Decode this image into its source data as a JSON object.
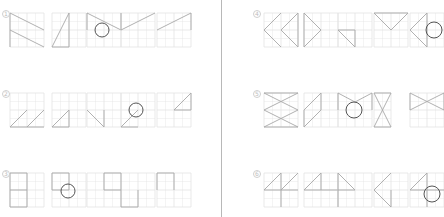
{
  "colors": {
    "grid": "#e3e3e3",
    "line": "#a8a8a8",
    "circle": "#555555",
    "divider": "#b8b8b8"
  },
  "rows": [
    {
      "label": "1",
      "lx": 2,
      "ly": 10,
      "panels": [
        {
          "x": 10,
          "y": 13,
          "w": 34,
          "h": 34,
          "lines": [
            [
              0,
              0,
              34,
              17
            ],
            [
              0,
              17,
              34,
              34
            ],
            [
              0,
              0,
              0,
              34
            ]
          ],
          "circle": null
        },
        {
          "x": 52,
          "y": 13,
          "w": 34,
          "h": 34,
          "lines": [
            [
              17,
              0,
              0,
              34
            ],
            [
              0,
              34,
              17,
              34
            ],
            [
              17,
              0,
              17,
              34
            ]
          ],
          "circle": null
        },
        {
          "x": 87,
          "y": 13,
          "w": 34,
          "h": 34,
          "lines": [
            [
              0,
              0,
              34,
              17
            ],
            [
              0,
              0,
              0,
              17
            ]
          ],
          "circle": [
            15,
            17,
            7
          ]
        },
        {
          "x": 121,
          "y": 13,
          "w": 34,
          "h": 34,
          "lines": [
            [
              0,
              17,
              34,
              0
            ],
            [
              0,
              0,
              0,
              17
            ]
          ],
          "circle": null
        },
        {
          "x": 157,
          "y": 13,
          "w": 34,
          "h": 34,
          "lines": [
            [
              0,
              17,
              34,
              0
            ],
            [
              34,
              0,
              34,
              17
            ]
          ],
          "circle": null
        }
      ]
    },
    {
      "label": "2",
      "lx": 2,
      "ly": 90,
      "panels": [
        {
          "x": 10,
          "y": 93,
          "w": 34,
          "h": 34,
          "lines": [
            [
              0,
              34,
              17,
              17
            ],
            [
              17,
              34,
              34,
              17
            ],
            [
              0,
              34,
              34,
              34
            ]
          ],
          "circle": null
        },
        {
          "x": 52,
          "y": 93,
          "w": 34,
          "h": 34,
          "lines": [
            [
              0,
              34,
              17,
              17
            ],
            [
              17,
              17,
              17,
              34
            ],
            [
              0,
              34,
              17,
              34
            ]
          ],
          "circle": null
        },
        {
          "x": 87,
          "y": 93,
          "w": 34,
          "h": 34,
          "lines": [
            [
              0,
              17,
              17,
              34
            ],
            [
              17,
              17,
              17,
              34
            ]
          ],
          "circle": null
        },
        {
          "x": 121,
          "y": 93,
          "w": 34,
          "h": 34,
          "lines": [
            [
              0,
              34,
              17,
              17
            ],
            [
              0,
              34,
              17,
              34
            ]
          ],
          "circle": [
            15,
            17,
            7
          ]
        },
        {
          "x": 157,
          "y": 93,
          "w": 34,
          "h": 34,
          "lines": [
            [
              17,
              17,
              34,
              0
            ],
            [
              17,
              17,
              34,
              17
            ],
            [
              34,
              0,
              34,
              17
            ]
          ],
          "circle": null
        }
      ]
    },
    {
      "label": "3",
      "lx": 2,
      "ly": 170,
      "panels": [
        {
          "x": 10,
          "y": 173,
          "w": 34,
          "h": 34,
          "lines": [
            [
              0,
              0,
              17,
              0
            ],
            [
              0,
              17,
              17,
              17
            ],
            [
              0,
              34,
              17,
              34
            ],
            [
              0,
              0,
              0,
              34
            ],
            [
              17,
              0,
              17,
              34
            ]
          ],
          "circle": null
        },
        {
          "x": 52,
          "y": 173,
          "w": 34,
          "h": 34,
          "lines": [
            [
              0,
              0,
              17,
              0
            ],
            [
              0,
              17,
              17,
              17
            ],
            [
              0,
              0,
              0,
              17
            ],
            [
              17,
              0,
              17,
              17
            ]
          ],
          "circle": [
            16,
            18,
            7
          ]
        },
        {
          "x": 87,
          "y": 173,
          "w": 68,
          "h": 34,
          "lines": [
            [
              17,
              0,
              34,
              0
            ],
            [
              17,
              17,
              34,
              17
            ],
            [
              17,
              0,
              17,
              17
            ],
            [
              34,
              0,
              34,
              17
            ],
            [
              34,
              17,
              34,
              34
            ],
            [
              51,
              17,
              51,
              34
            ],
            [
              34,
              34,
              51,
              34
            ]
          ],
          "circle": null
        },
        {
          "x": 157,
          "y": 173,
          "w": 34,
          "h": 34,
          "lines": [
            [
              0,
              0,
              17,
              0
            ],
            [
              0,
              0,
              0,
              17
            ],
            [
              17,
              0,
              17,
              17
            ]
          ],
          "circle": null
        }
      ]
    }
  ],
  "rows_right": [
    {
      "label": "4",
      "lx": 253,
      "ly": 10,
      "panels": [
        {
          "x": 264,
          "y": 13,
          "w": 34,
          "h": 34,
          "lines": [
            [
              17,
              0,
              0,
              17
            ],
            [
              0,
              17,
              17,
              34
            ],
            [
              34,
              0,
              17,
              17
            ],
            [
              17,
              17,
              34,
              34
            ],
            [
              34,
              0,
              34,
              34
            ]
          ],
          "circle": null
        },
        {
          "x": 304,
          "y": 13,
          "w": 34,
          "h": 34,
          "lines": [
            [
              0,
              0,
              17,
              17
            ],
            [
              17,
              17,
              0,
              34
            ],
            [
              0,
              0,
              0,
              34
            ]
          ],
          "circle": null
        },
        {
          "x": 338,
          "y": 13,
          "w": 34,
          "h": 34,
          "lines": [
            [
              0,
              17,
              17,
              34
            ],
            [
              0,
              17,
              17,
              17
            ],
            [
              17,
              17,
              17,
              34
            ]
          ],
          "circle": null
        },
        {
          "x": 374,
          "y": 13,
          "w": 34,
          "h": 34,
          "lines": [
            [
              0,
              0,
              34,
              0
            ],
            [
              0,
              0,
              17,
              17
            ],
            [
              34,
              0,
              17,
              17
            ]
          ],
          "circle": null
        },
        {
          "x": 410,
          "y": 13,
          "w": 34,
          "h": 34,
          "lines": [
            [
              17,
              0,
              0,
              17
            ],
            [
              0,
              17,
              17,
              34
            ],
            [
              17,
              0,
              17,
              34
            ]
          ],
          "circle": [
            24,
            17,
            8
          ]
        }
      ]
    },
    {
      "label": "5",
      "lx": 253,
      "ly": 90,
      "panels": [
        {
          "x": 264,
          "y": 93,
          "w": 34,
          "h": 34,
          "lines": [
            [
              0,
              0,
              34,
              17
            ],
            [
              34,
              0,
              0,
              17
            ],
            [
              0,
              17,
              34,
              34
            ],
            [
              34,
              17,
              0,
              34
            ],
            [
              0,
              0,
              34,
              0
            ],
            [
              0,
              34,
              34,
              34
            ]
          ],
          "circle": null
        },
        {
          "x": 304,
          "y": 93,
          "w": 34,
          "h": 34,
          "lines": [
            [
              17,
              0,
              0,
              17
            ],
            [
              17,
              17,
              0,
              34
            ],
            [
              17,
              0,
              17,
              17
            ],
            [
              0,
              17,
              0,
              34
            ]
          ],
          "circle": null
        },
        {
          "x": 338,
          "y": 93,
          "w": 34,
          "h": 34,
          "lines": [
            [
              0,
              0,
              17,
              9
            ],
            [
              34,
              0,
              17,
              9
            ],
            [
              0,
              0,
              0,
              17
            ],
            [
              34,
              0,
              34,
              17
            ]
          ],
          "circle": [
            16,
            17,
            8
          ]
        },
        {
          "x": 374,
          "y": 93,
          "w": 17,
          "h": 34,
          "lines": [
            [
              0,
              0,
              17,
              0
            ],
            [
              0,
              34,
              17,
              34
            ],
            [
              0,
              0,
              17,
              34
            ],
            [
              17,
              0,
              0,
              34
            ]
          ],
          "circle": null
        },
        {
          "x": 410,
          "y": 93,
          "w": 34,
          "h": 34,
          "lines": [
            [
              0,
              0,
              34,
              17
            ],
            [
              34,
              0,
              0,
              17
            ],
            [
              0,
              0,
              0,
              17
            ],
            [
              34,
              0,
              34,
              17
            ]
          ],
          "circle": null
        }
      ]
    },
    {
      "label": "6",
      "lx": 253,
      "ly": 170,
      "panels": [
        {
          "x": 264,
          "y": 173,
          "w": 34,
          "h": 34,
          "lines": [
            [
              17,
              0,
              0,
              17
            ],
            [
              0,
              17,
              34,
              17
            ],
            [
              34,
              0,
              17,
              17
            ],
            [
              17,
              17,
              17,
              34
            ],
            [
              17,
              0,
              17,
              17
            ]
          ],
          "circle": null
        },
        {
          "x": 304,
          "y": 173,
          "w": 34,
          "h": 34,
          "lines": [
            [
              17,
              0,
              0,
              17
            ],
            [
              0,
              17,
              34,
              17
            ],
            [
              17,
              0,
              17,
              17
            ]
          ],
          "circle": null
        },
        {
          "x": 338,
          "y": 173,
          "w": 34,
          "h": 34,
          "lines": [
            [
              0,
              0,
              17,
              17
            ],
            [
              0,
              0,
              0,
              34
            ],
            [
              0,
              17,
              17,
              17
            ]
          ],
          "circle": null
        },
        {
          "x": 374,
          "y": 173,
          "w": 34,
          "h": 34,
          "lines": [
            [
              17,
              0,
              0,
              17
            ],
            [
              0,
              17,
              17,
              34
            ],
            [
              17,
              17,
              17,
              34
            ]
          ],
          "circle": null
        },
        {
          "x": 410,
          "y": 173,
          "w": 34,
          "h": 34,
          "lines": [
            [
              17,
              0,
              0,
              17
            ],
            [
              0,
              17,
              34,
              17
            ],
            [
              17,
              0,
              17,
              34
            ]
          ],
          "circle": [
            22,
            21,
            8
          ]
        }
      ]
    }
  ]
}
